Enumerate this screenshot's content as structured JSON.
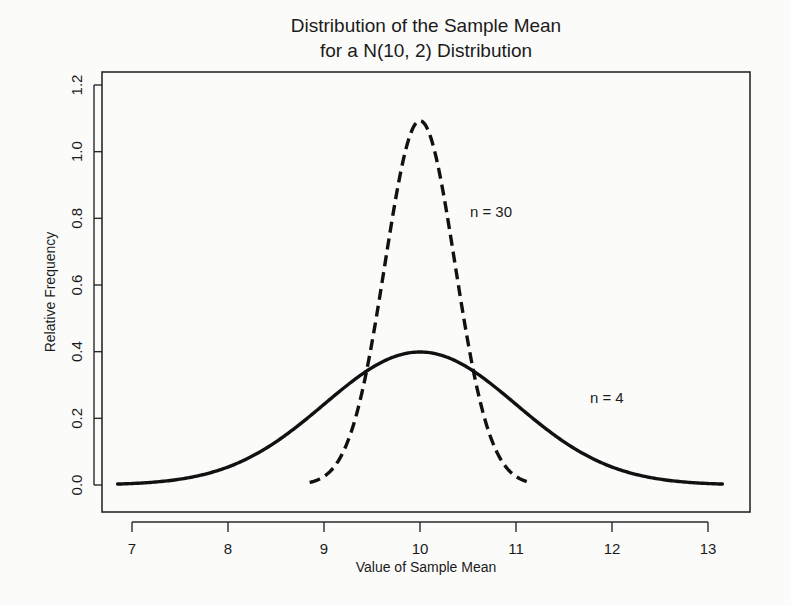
{
  "figure": {
    "title_line1": "Distribution of the Sample Mean",
    "title_line2": "for a N(10, 2) Distribution",
    "background_color": "#fbfbfa",
    "ink_color": "#111111"
  },
  "chart_data": {
    "type": "line",
    "title": "Distribution of the Sample Mean for a N(10, 2) Distribution",
    "xlabel": "Value of Sample Mean",
    "ylabel": "Relative Frequency",
    "xlim": [
      6.85,
      13.15
    ],
    "ylim": [
      0.0,
      1.28
    ],
    "xticks": [
      7,
      8,
      9,
      10,
      11,
      12,
      13
    ],
    "xtick_labels": [
      "7",
      "8",
      "9",
      "10",
      "11",
      "12",
      "13"
    ],
    "yticks": [
      0.0,
      0.2,
      0.4,
      0.6,
      0.8,
      1.0,
      1.2
    ],
    "ytick_labels": [
      "0.0",
      "0.2",
      "0.4",
      "0.6",
      "0.8",
      "1.0",
      "1.2"
    ],
    "grid": false,
    "legend_position": "inline-annotations",
    "population": {
      "mean": 10,
      "sd": 2,
      "notation": "N(10, 2)"
    },
    "series": [
      {
        "name": "n = 4",
        "label": "n = 4",
        "style": "solid",
        "sample_size": 4,
        "mean": 10,
        "standard_error": 1.0,
        "peak_value": 0.399,
        "peak_at_x": 10,
        "x_range": [
          6.85,
          13.15
        ],
        "x": [
          6.85,
          7.0,
          7.25,
          7.5,
          7.75,
          8.0,
          8.25,
          8.5,
          8.75,
          9.0,
          9.25,
          9.5,
          9.75,
          10.0,
          10.25,
          10.5,
          10.75,
          11.0,
          11.25,
          11.5,
          11.75,
          12.0,
          12.25,
          12.5,
          12.75,
          13.0,
          13.15
        ],
        "values": [
          0.0088,
          0.0044,
          0.0175,
          0.0175,
          0.0339,
          0.054,
          0.0804,
          0.1295,
          0.1826,
          0.242,
          0.3011,
          0.3521,
          0.3867,
          0.3989,
          0.3867,
          0.3521,
          0.3011,
          0.242,
          0.1826,
          0.1295,
          0.0804,
          0.054,
          0.0339,
          0.0175,
          0.0088,
          0.0044,
          0.0031
        ]
      },
      {
        "name": "n = 30",
        "label": "n = 30",
        "style": "dashed",
        "sample_size": 30,
        "mean": 10,
        "standard_error": 0.3651,
        "peak_value": 1.0925,
        "peak_at_x": 10,
        "x_range": [
          8.85,
          11.15
        ],
        "x": [
          8.85,
          9.0,
          9.15,
          9.3,
          9.45,
          9.6,
          9.75,
          9.9,
          10.0,
          10.1,
          10.25,
          10.4,
          10.55,
          10.7,
          10.85,
          11.0,
          11.15
        ],
        "values": [
          0.0193,
          0.0441,
          0.0921,
          0.1759,
          0.3073,
          0.4905,
          0.7153,
          0.9529,
          1.0925,
          0.9529,
          0.7153,
          0.4905,
          0.3073,
          0.1759,
          0.0921,
          0.0441,
          0.0193
        ]
      }
    ],
    "annotations": [
      {
        "text": "n = 30",
        "x": 10.52,
        "y": 0.805
      },
      {
        "text": "n = 4",
        "x": 11.77,
        "y": 0.245
      }
    ]
  }
}
